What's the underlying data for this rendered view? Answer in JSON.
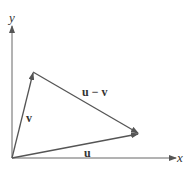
{
  "diagram": {
    "axes": {
      "x_label": "x",
      "y_label": "y"
    },
    "vectors": [
      {
        "name": "u",
        "label": "u"
      },
      {
        "name": "v",
        "label": "v"
      },
      {
        "name": "u-minus-v",
        "label": "u − v"
      }
    ],
    "colors": {
      "line": "#555555",
      "axis": "#666666"
    }
  }
}
